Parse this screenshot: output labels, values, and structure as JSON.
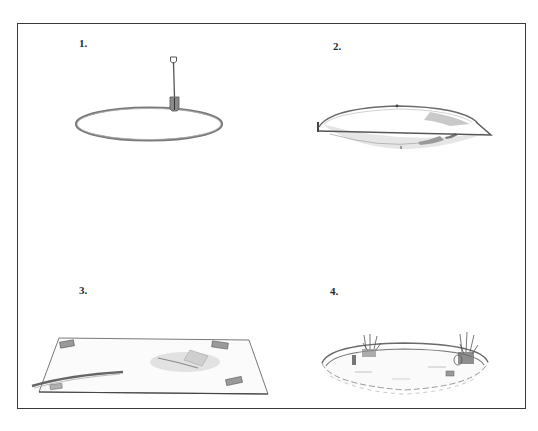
{
  "figure": {
    "colors": {
      "frame": "#3a3a3a",
      "ink": "#555555",
      "shade": "#8a8a8a",
      "light_shade": "#c8c8c8",
      "background": "#ffffff"
    },
    "steps": [
      {
        "number": "1.",
        "subject": "Marking out a circle on the ground with a spade"
      },
      {
        "number": "2.",
        "subject": "Dug shallow saucer-shaped pond hole"
      },
      {
        "number": "3.",
        "subject": "Liner laid over hole, weighted at corners with bricks"
      },
      {
        "number": "4.",
        "subject": "Finished pond with stone edging and marginal plants"
      }
    ]
  }
}
